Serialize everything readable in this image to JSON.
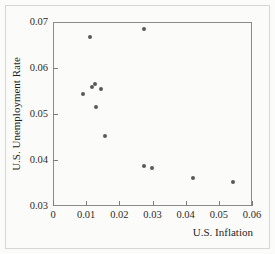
{
  "chart_data": {
    "type": "scatter",
    "title": "",
    "xlabel": "U.S. Inflation",
    "ylabel": "U.S. Unemployment Rate",
    "xlim": [
      0,
      0.06
    ],
    "ylim": [
      0.03,
      0.07
    ],
    "xticks": [
      0,
      0.01,
      0.02,
      0.03,
      0.04,
      0.05,
      0.06
    ],
    "xticklabels": [
      "0",
      "0.01",
      "0.02",
      "0.03",
      "0.04",
      "0.05",
      "0.06"
    ],
    "yticks": [
      0.03,
      0.04,
      0.05,
      0.06,
      0.07
    ],
    "yticklabels": [
      "0.03",
      "0.04",
      "0.05",
      "0.06",
      "0.07"
    ],
    "grid": false,
    "legend": null,
    "marker": "dot",
    "marker_color": "#595959",
    "points": [
      {
        "x": 0.0112,
        "y": 0.0667
      },
      {
        "x": 0.0275,
        "y": 0.0684
      },
      {
        "x": 0.009,
        "y": 0.0544
      },
      {
        "x": 0.0119,
        "y": 0.0558
      },
      {
        "x": 0.0127,
        "y": 0.0566
      },
      {
        "x": 0.0146,
        "y": 0.0555
      },
      {
        "x": 0.0129,
        "y": 0.0515
      },
      {
        "x": 0.0157,
        "y": 0.0452
      },
      {
        "x": 0.0274,
        "y": 0.0387
      },
      {
        "x": 0.0297,
        "y": 0.0383
      },
      {
        "x": 0.0423,
        "y": 0.036
      },
      {
        "x": 0.0543,
        "y": 0.0353
      }
    ]
  }
}
